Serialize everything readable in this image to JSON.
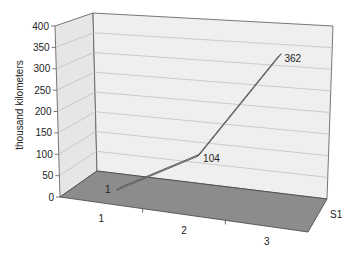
{
  "chart_data": {
    "type": "line",
    "style": "3d-line",
    "title": "",
    "xlabel": "",
    "ylabel": "thousand kilometers",
    "categories": [
      "1",
      "2",
      "3"
    ],
    "series": [
      {
        "name": "S1",
        "values": [
          1,
          104,
          362
        ]
      }
    ],
    "data_labels": [
      "1",
      "104",
      "362"
    ],
    "y_ticks": [
      "0",
      "50",
      "100",
      "150",
      "200",
      "250",
      "300",
      "350",
      "400"
    ],
    "ylim": [
      0,
      400
    ],
    "depth_axis_label": "S1",
    "grid": true,
    "legend": "none"
  },
  "colors": {
    "wall": "#ececec",
    "floor": "#8c8c8c",
    "gridline": "#b8b8b8",
    "axis": "#555555",
    "ribbon_top": "#bdbdbd",
    "ribbon_edge": "#444444"
  }
}
